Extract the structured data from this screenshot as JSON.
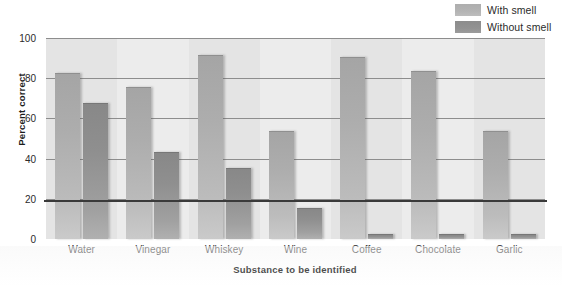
{
  "chart_data": {
    "type": "bar",
    "title": "",
    "xlabel": "Substance to be identified",
    "ylabel": "Percent correct",
    "categories": [
      "Water",
      "Vinegar",
      "Whiskey",
      "Wine",
      "Coffee",
      "Chocolate",
      "Garlic"
    ],
    "series": [
      {
        "name": "With smell",
        "values": [
          82,
          75,
          91,
          53,
          90,
          83,
          53
        ],
        "color": "#b4b4b4"
      },
      {
        "name": "Without smell",
        "values": [
          67,
          43,
          35,
          15,
          2,
          2,
          2
        ],
        "color": "#929292"
      }
    ],
    "ylim": [
      0,
      100
    ],
    "yticks": [
      0,
      20,
      40,
      60,
      80,
      100
    ],
    "ytick_labels": [
      "0",
      "20",
      "40",
      "60",
      "80",
      "100"
    ],
    "grid": true,
    "legend_position": "top-right"
  },
  "legend": {
    "items": [
      {
        "label": "With smell"
      },
      {
        "label": "Without smell"
      }
    ]
  }
}
